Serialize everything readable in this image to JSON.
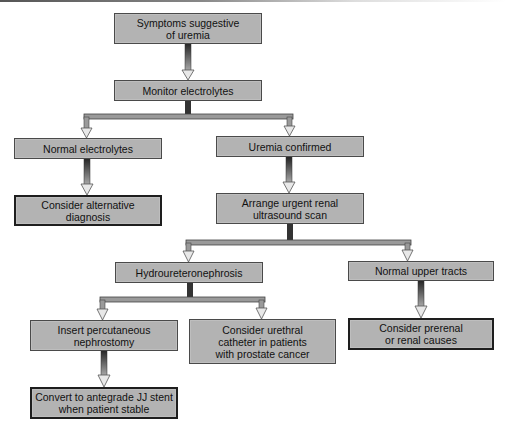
{
  "diagram": {
    "type": "flowchart",
    "colors": {
      "box_fill": "#b3b3b3",
      "box_border": "#4a4a4a",
      "terminal_border": "#1e1e1e",
      "connector_fill": "#9a9a9a",
      "arrowhead_fill": "#e8e8e8"
    },
    "nodes": [
      {
        "id": "symptoms",
        "label": "Symptoms suggestive\nof uremia"
      },
      {
        "id": "monitor",
        "label": "Monitor electrolytes"
      },
      {
        "id": "normal_electrolytes",
        "label": "Normal electrolytes"
      },
      {
        "id": "uremia_confirmed",
        "label": "Uremia confirmed"
      },
      {
        "id": "alternative_diagnosis",
        "label": "Consider alternative\ndiagnosis"
      },
      {
        "id": "ultrasound",
        "label": "Arrange urgent renal\nultrasound scan"
      },
      {
        "id": "hydro",
        "label": "Hydroureteronephrosis"
      },
      {
        "id": "normal_upper",
        "label": "Normal upper tracts"
      },
      {
        "id": "nephrostomy",
        "label": "Insert percutaneous\nnephrostomy"
      },
      {
        "id": "urethral",
        "label": "Consider urethral\ncatheter in patients\nwith prostate cancer"
      },
      {
        "id": "prerenal",
        "label": "Consider prerenal\nor renal causes"
      },
      {
        "id": "jj_stent",
        "label": "Convert to antegrade JJ stent\nwhen patient stable"
      }
    ],
    "edges": [
      [
        "symptoms",
        "monitor"
      ],
      [
        "monitor",
        "normal_electrolytes"
      ],
      [
        "monitor",
        "uremia_confirmed"
      ],
      [
        "normal_electrolytes",
        "alternative_diagnosis"
      ],
      [
        "uremia_confirmed",
        "ultrasound"
      ],
      [
        "ultrasound",
        "hydro"
      ],
      [
        "ultrasound",
        "normal_upper"
      ],
      [
        "hydro",
        "nephrostomy"
      ],
      [
        "hydro",
        "urethral"
      ],
      [
        "normal_upper",
        "prerenal"
      ],
      [
        "nephrostomy",
        "jj_stent"
      ]
    ]
  }
}
